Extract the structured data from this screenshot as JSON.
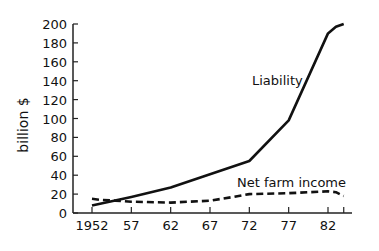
{
  "chart_data": {
    "type": "line",
    "title": "",
    "xlabel": "",
    "ylabel": "billion $",
    "ylim": [
      0,
      200
    ],
    "yticks": [
      0,
      20,
      40,
      60,
      80,
      100,
      120,
      140,
      160,
      180,
      200
    ],
    "xticks": [
      1952,
      1957,
      1962,
      1967,
      1972,
      1977,
      1982,
      1984
    ],
    "xtick_labels": [
      "1952",
      "57",
      "62",
      "67",
      "72",
      "77",
      "82",
      ""
    ],
    "xlim": [
      1952,
      1984
    ],
    "grid": false,
    "legend": "inline labels",
    "series": [
      {
        "name": "Liability",
        "style": "solid",
        "x": [
          1952,
          1957,
          1962,
          1967,
          1972,
          1977,
          1982,
          1983,
          1984
        ],
        "values": [
          8,
          17,
          27,
          41,
          55,
          98,
          190,
          197,
          200
        ]
      },
      {
        "name": "Net farm income",
        "style": "dashed",
        "x": [
          1952,
          1953,
          1955,
          1957,
          1962,
          1967,
          1970,
          1972,
          1977,
          1982,
          1983,
          1984
        ],
        "values": [
          15,
          14,
          13,
          12,
          11,
          13,
          17,
          20,
          21,
          23,
          22,
          18
        ]
      }
    ],
    "annotations": [
      {
        "text": "Liability",
        "x": 1974,
        "y": 130
      },
      {
        "text": "Net farm income",
        "x": 1974,
        "y": 33
      }
    ]
  }
}
